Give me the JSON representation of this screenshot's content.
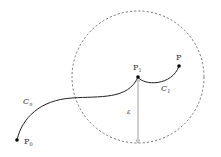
{
  "diagram": {
    "labels": {
      "p_target": "P",
      "p_one": "P",
      "p_one_sub": "1",
      "p_zero": "P",
      "p_zero_sub": "0",
      "c_one": "C",
      "c_one_sub": "1",
      "c_n": "C",
      "c_n_sub": "n",
      "epsilon": "ε"
    },
    "colors": {
      "curve": "#222222",
      "circle": "#555555",
      "arrow": "#888888",
      "point": "#000000"
    },
    "circle": {
      "cx": 138,
      "cy": 77,
      "r": 66,
      "style": "dashed"
    }
  }
}
